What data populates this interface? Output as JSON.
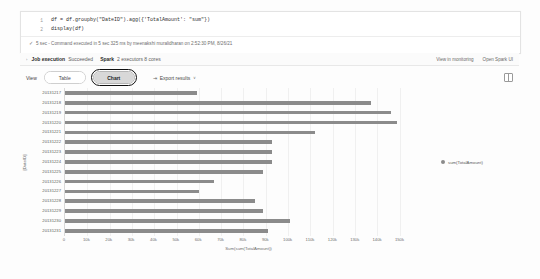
{
  "cell": {
    "lines": [
      {
        "n": "1",
        "code": "df = df.groupby(\"DateID\").agg({'TotalAmount': \"sum\"})"
      },
      {
        "n": "2",
        "code": "display(df)"
      }
    ],
    "status_check": "✓",
    "status_text": "5 sec - Command executed in 5 sec 325 ms by meenakshi muralidharan on 2:52:30 PM, 8/26/21"
  },
  "job": {
    "chevron": "›",
    "title": "Job execution",
    "state": "Succeeded",
    "spark_label": "Spark",
    "spark_detail": "2 executors 8 cores",
    "link_monitoring": "View in monitoring",
    "link_spark_ui": "Open Spark UI"
  },
  "toolbar": {
    "view_label": "View",
    "table_label": "Table",
    "chart_label": "Chart",
    "export_icon": "⇥",
    "export_label": "Export results",
    "export_caret": "∨",
    "grid_icon": "table-view-icon"
  },
  "chart_data": {
    "type": "bar",
    "orientation": "horizontal",
    "title": "",
    "xlabel": "Sum(sum(TotalAmount))",
    "ylabel": "[DateID]",
    "xlim": [
      0,
      165000
    ],
    "grid": true,
    "legend_position": "right",
    "legend": [
      "sum(TotalAmount)"
    ],
    "series_color": "#8b8b8b",
    "xticks": [
      "0",
      "10k",
      "20k",
      "30k",
      "40k",
      "50k",
      "60k",
      "70k",
      "80k",
      "90k",
      "100k",
      "110k",
      "120k",
      "130k",
      "140k",
      "150k"
    ],
    "categories": [
      "20131217",
      "20131218",
      "20131219",
      "20131220",
      "20131221",
      "20131222",
      "20131223",
      "20131224",
      "20131225",
      "20131226",
      "20131227",
      "20131228",
      "20131229",
      "20131230",
      "20131231"
    ],
    "values": [
      59000,
      137000,
      146000,
      149000,
      112000,
      93000,
      93000,
      93000,
      89000,
      67000,
      60000,
      85000,
      89000,
      101000,
      91000
    ]
  }
}
